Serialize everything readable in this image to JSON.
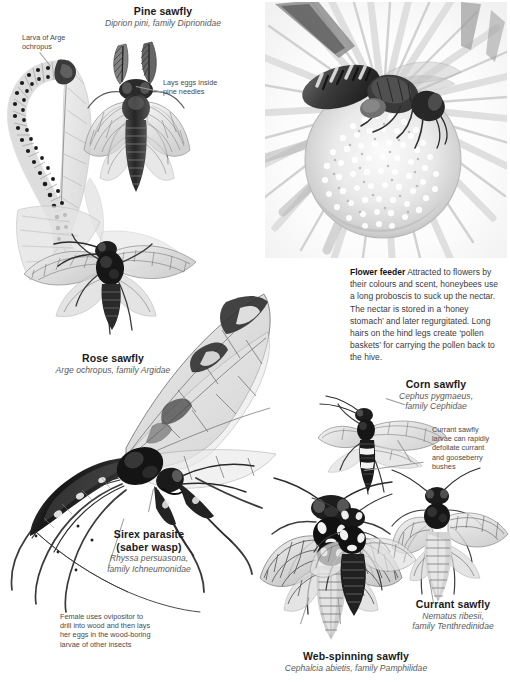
{
  "page": {
    "background_color": "#ffffff",
    "width": 510,
    "height": 690,
    "kind": "illustrated reference page about sawflies and parasitic wasps"
  },
  "colors": {
    "heading": "#1a1a1a",
    "subheading": "#5b5b5b",
    "annotation": "#4a4a4a",
    "body": "#3b3b3b",
    "leader_line": "#9a9a9a",
    "ink": "#2b2b2b",
    "wash_light": "#d9d9d9",
    "wash_mid": "#a8a8a8",
    "wash_dark": "#6f6f6f"
  },
  "labels": {
    "pine_sawfly": {
      "title": "Pine sawfly",
      "subtitle": "Diprion pini, family Diprionidae"
    },
    "rose_sawfly": {
      "title": "Rose sawfly",
      "subtitle": "Arge ochropus, family Argidae"
    },
    "sirex_parasite": {
      "title_line1": "Sirex parasite",
      "title_line2": "(saber wasp)",
      "subtitle_line1": "Rhyssa persuasona,",
      "subtitle_line2": "family Ichneumonidae"
    },
    "corn_sawfly": {
      "title": "Corn sawfly",
      "subtitle_line1": "Cephus pygmaeus,",
      "subtitle_line2": "family Cephidae"
    },
    "currant_sawfly": {
      "title": "Currant sawfly",
      "subtitle_line1": "Nematus ribesii,",
      "subtitle_line2": "family Tenthredinidae"
    },
    "web_spinning_sawfly": {
      "title": "Web-spinning sawfly",
      "subtitle": "Cephalcia abietis, family Pamphilidae"
    }
  },
  "annotations": {
    "larva_of_arge": "Larva of Arge\nochropus",
    "lays_eggs": "Lays eggs inside\npine needles",
    "female_ovipositor": "Female uses ovipositor to\ndrill into wood and then lays\nher eggs in the wood-boring\nlarvae of other insects",
    "currant_larvae": "Currant sawfly\nlarvae can rapidly\ndefoliate currant\nand gooseberry\nbushes"
  },
  "flower_feeder": {
    "lead": "Flower feeder",
    "body": " Attracted to flowers by their colours and scent, honeybees use a long proboscis to suck up the nectar. The nectar is stored in a ‘honey stomach’ and later regurgitated. Long hairs on the hind legs create ‘pollen baskets’ for carrying the pollen back to the hive."
  },
  "photo": {
    "caption_subject": "honeybee on a daisy flower head",
    "style": "black and white photograph"
  },
  "illustrations": [
    {
      "name": "arge-larva-caterpillar",
      "description": "spotted sawfly larva curled on a leaf"
    },
    {
      "name": "pine-sawfly-adult",
      "description": "adult pine sawfly with feathered antennae, dorsal view"
    },
    {
      "name": "rose-sawfly-adult",
      "description": "adult rose sawfly on a leaf, wings spread"
    },
    {
      "name": "sirex-parasite-wasp",
      "description": "large ichneumon wasp with long legs and ovipositor"
    },
    {
      "name": "corn-sawfly-adult",
      "description": "slender corn sawfly, dorsal view"
    },
    {
      "name": "web-spinning-sawfly-adult",
      "description": "stout web-spinning sawfly, dorsal view"
    },
    {
      "name": "currant-sawfly-adult",
      "description": "currant sawfly with pale abdomen, dorsal view"
    },
    {
      "name": "currant-sawfly-secondary",
      "description": "second currant sawfly, partial view at lower left"
    }
  ]
}
